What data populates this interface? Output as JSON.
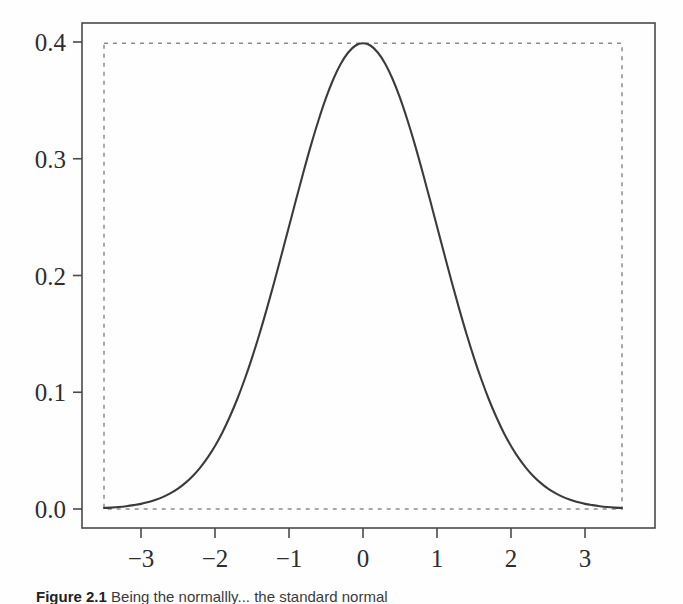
{
  "figure": {
    "caption_label": "Figure 2.1",
    "caption_body": "Being the normallly... the standard normal"
  },
  "axes": {
    "x_tick_labels": [
      "−3",
      "−2",
      "−1",
      "0",
      "1",
      "2",
      "3"
    ],
    "x_tick_values": [
      -3,
      -2,
      -1,
      0,
      1,
      2,
      3
    ],
    "y_tick_labels": [
      "0.0",
      "0.1",
      "0.2",
      "0.3",
      "0.4"
    ],
    "y_tick_values": [
      0.0,
      0.1,
      0.2,
      0.3,
      0.4
    ],
    "xlim": [
      -3.6,
      3.6
    ],
    "ylim": [
      -0.01,
      0.41
    ],
    "box_color": "#4a4a4a",
    "tick_color": "#4a4a4a"
  },
  "chart_data": {
    "type": "line",
    "title": "",
    "xlabel": "",
    "ylabel": "",
    "xlim": [
      -3.6,
      3.6
    ],
    "ylim": [
      -0.01,
      0.41
    ],
    "grid": false,
    "legend": "none",
    "series": [
      {
        "name": "standard normal density",
        "color": "#3b3b3b",
        "style": "solid",
        "x": [
          -3.5,
          -3.4,
          -3.3,
          -3.2,
          -3.1,
          -3.0,
          -2.9,
          -2.8,
          -2.7,
          -2.6,
          -2.5,
          -2.4,
          -2.3,
          -2.2,
          -2.1,
          -2.0,
          -1.9,
          -1.8,
          -1.7,
          -1.6,
          -1.5,
          -1.4,
          -1.3,
          -1.2,
          -1.1,
          -1.0,
          -0.9,
          -0.8,
          -0.7,
          -0.6,
          -0.5,
          -0.4,
          -0.3,
          -0.2,
          -0.1,
          0.0,
          0.1,
          0.2,
          0.3,
          0.4,
          0.5,
          0.6,
          0.7,
          0.8,
          0.9,
          1.0,
          1.1,
          1.2,
          1.3,
          1.4,
          1.5,
          1.6,
          1.7,
          1.8,
          1.9,
          2.0,
          2.1,
          2.2,
          2.3,
          2.4,
          2.5,
          2.6,
          2.7,
          2.8,
          2.9,
          3.0,
          3.1,
          3.2,
          3.3,
          3.4,
          3.5
        ],
        "y": [
          0.0009,
          0.0012,
          0.0017,
          0.0024,
          0.0033,
          0.0044,
          0.006,
          0.0079,
          0.0104,
          0.0136,
          0.0175,
          0.0224,
          0.0283,
          0.0355,
          0.044,
          0.054,
          0.0656,
          0.079,
          0.094,
          0.1109,
          0.1295,
          0.1497,
          0.1714,
          0.1942,
          0.2179,
          0.242,
          0.2661,
          0.2897,
          0.3123,
          0.3332,
          0.3521,
          0.3683,
          0.3814,
          0.391,
          0.397,
          0.3989,
          0.397,
          0.391,
          0.3814,
          0.3683,
          0.3521,
          0.3332,
          0.3123,
          0.2897,
          0.2661,
          0.242,
          0.2179,
          0.1942,
          0.1714,
          0.1497,
          0.1295,
          0.1109,
          0.094,
          0.079,
          0.0656,
          0.054,
          0.044,
          0.0355,
          0.0283,
          0.0224,
          0.0175,
          0.0136,
          0.0104,
          0.0079,
          0.006,
          0.0044,
          0.0033,
          0.0024,
          0.0017,
          0.0012,
          0.0009
        ]
      }
    ],
    "annotations": [
      {
        "name": "dashed-reference-rectangle",
        "type": "rect",
        "x0": -3.5,
        "x1": 3.5,
        "y0": 0.0,
        "y1": 0.3989,
        "style": "dashed",
        "color": "#8a8a92"
      }
    ]
  }
}
